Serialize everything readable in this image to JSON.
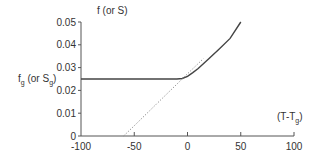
{
  "chart_data": {
    "type": "line",
    "title": "",
    "xlabel": "(T-Tg)",
    "xlabel_main": "(T-T",
    "xlabel_sub": "g",
    "xlabel_close": ")",
    "ylabel": "f (or S)",
    "ylabel_secondary": "fg (or Sg)",
    "ylabel_secondary_parts": {
      "f": "f",
      "sub1": "g",
      "mid": " (or S",
      "sub2": "g",
      "close": ")"
    },
    "xlim": [
      -100,
      100
    ],
    "ylim": [
      0,
      0.05
    ],
    "x_ticks": [
      -100,
      -50,
      0,
      50,
      100
    ],
    "x_tick_labels": [
      "-100",
      "-50",
      "0",
      "50",
      "100"
    ],
    "y_ticks": [
      0,
      0.01,
      0.02,
      0.03,
      0.04,
      0.05
    ],
    "y_tick_labels": [
      "0",
      "0.01",
      "0.02",
      "0.03",
      "0.04",
      "0.05"
    ],
    "grid": false,
    "legend": null,
    "series": [
      {
        "name": "f (or S) solid curve",
        "style": "solid",
        "x": [
          -100,
          -50,
          -10,
          -5,
          0,
          5,
          10,
          20,
          30,
          40,
          50
        ],
        "values": [
          0.025,
          0.025,
          0.025,
          0.0252,
          0.0262,
          0.0278,
          0.0296,
          0.0339,
          0.0383,
          0.0428,
          0.05
        ]
      },
      {
        "name": "linear extrapolation (dotted)",
        "style": "dotted",
        "x": [
          -60,
          -50,
          -25,
          0,
          15
        ],
        "values": [
          0.0,
          0.0045,
          0.0159,
          0.0273,
          0.034
        ]
      }
    ],
    "annotations": [
      {
        "text": "fg (or Sg)",
        "position": "left of y-axis at y=0.025"
      }
    ]
  }
}
